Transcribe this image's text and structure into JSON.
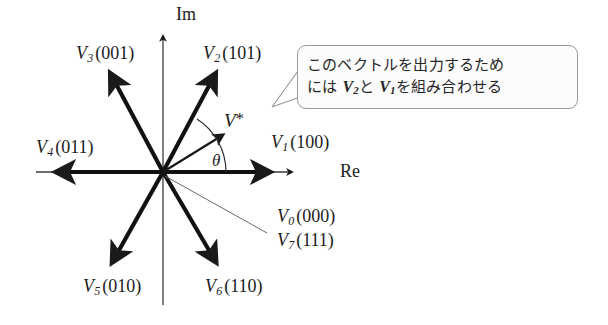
{
  "figure": {
    "type": "space-vector-hexagon-diagram",
    "origin": {
      "x": 163,
      "y": 172
    },
    "axes": {
      "imaginary": {
        "label": "Im",
        "label_x": 176,
        "label_y": 6,
        "tip_x": 163,
        "tip_y": 36,
        "bottom_y": 305
      },
      "real": {
        "label": "Re",
        "label_x": 340,
        "label_y": 163,
        "tip_x": 292,
        "tip_y": 172,
        "left_x": 36
      }
    },
    "angle": {
      "symbol": "θ",
      "label_x": 212,
      "label_y": 152
    },
    "reference_vector": {
      "label_prefix": "V",
      "label_suffix": "*",
      "label_x": 224,
      "label_y": 111,
      "tip_x": 223,
      "tip_y": 133
    },
    "vectors": [
      {
        "name": "V1",
        "letter": "V",
        "index": "1",
        "bits": "(100)",
        "tip_x": 263,
        "tip_y": 172,
        "label_x": 271,
        "label_y": 134
      },
      {
        "name": "V2",
        "letter": "V",
        "index": "2",
        "bits": "(101)",
        "tip_x": 214,
        "tip_y": 79,
        "label_x": 203,
        "label_y": 45
      },
      {
        "name": "V3",
        "letter": "V",
        "index": "3",
        "bits": "(001)",
        "tip_x": 112,
        "tip_y": 79,
        "label_x": 76,
        "label_y": 45
      },
      {
        "name": "V4",
        "letter": "V",
        "index": "4",
        "bits": "(011)",
        "tip_x": 62,
        "tip_y": 172,
        "label_x": 36,
        "label_y": 139
      },
      {
        "name": "V5",
        "letter": "V",
        "index": "5",
        "bits": "(010)",
        "tip_x": 113,
        "tip_y": 258,
        "label_x": 83,
        "label_y": 278
      },
      {
        "name": "V6",
        "letter": "V",
        "index": "6",
        "bits": "(110)",
        "tip_x": 215,
        "tip_y": 258,
        "label_x": 205,
        "label_y": 278
      }
    ],
    "zero_vectors": {
      "leader_tip_x": 267,
      "leader_tip_y": 233,
      "items": [
        {
          "name": "V0",
          "letter": "V",
          "index": "0",
          "bits": "(000)",
          "label_x": 277,
          "label_y": 208
        },
        {
          "name": "V7",
          "letter": "V",
          "index": "7",
          "bits": "(111)",
          "label_x": 277,
          "label_y": 232
        }
      ]
    },
    "callout": {
      "line1": "このベクトルを出力するため",
      "line2_pre": "には ",
      "line2_v1_letter": "V",
      "line2_v1_index": "2",
      "line2_mid": "と ",
      "line2_v2_letter": "V",
      "line2_v2_index": "1",
      "line2_post": "を組み合わせる",
      "pointer_tip_x": 272,
      "pointer_tip_y": 107
    },
    "colors": {
      "stroke": "#1a1a1a",
      "thin_stroke": "#555555",
      "callout_border": "#9a9a9a",
      "callout_fill": "#fcfcfc",
      "background": "#ffffff"
    }
  }
}
